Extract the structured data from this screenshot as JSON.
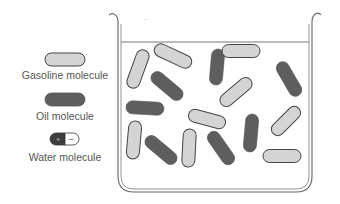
{
  "legend": [
    {
      "label": "Gasoline molecule",
      "type": "gasoline"
    },
    {
      "label": "Oil molecule",
      "type": "oil"
    },
    {
      "label": "Water molecule",
      "type": "water",
      "left_sign": "+",
      "right_sign": "−"
    }
  ],
  "colors": {
    "gasoline_fill": "#d4d4d4",
    "oil_fill": "#5e5e5e",
    "outline": "#444444",
    "beaker": "#666666",
    "text": "#555555"
  },
  "beaker": {
    "top_mark": "..."
  },
  "molecules": [
    {
      "type": "gasoline",
      "cx": 138,
      "cy": 69,
      "len": 40,
      "angle": -70
    },
    {
      "type": "gasoline",
      "cx": 173,
      "cy": 56,
      "len": 40,
      "angle": 25
    },
    {
      "type": "oil",
      "cx": 217,
      "cy": 67,
      "len": 36,
      "angle": -85
    },
    {
      "type": "gasoline",
      "cx": 241,
      "cy": 51,
      "len": 38,
      "angle": 0
    },
    {
      "type": "oil",
      "cx": 289,
      "cy": 79,
      "len": 38,
      "angle": 60
    },
    {
      "type": "oil",
      "cx": 167,
      "cy": 86,
      "len": 38,
      "angle": 40
    },
    {
      "type": "gasoline",
      "cx": 236,
      "cy": 92,
      "len": 38,
      "angle": -40
    },
    {
      "type": "oil",
      "cx": 145,
      "cy": 108,
      "len": 38,
      "angle": 3
    },
    {
      "type": "gasoline",
      "cx": 207,
      "cy": 119,
      "len": 38,
      "angle": 15
    },
    {
      "type": "gasoline",
      "cx": 286,
      "cy": 121,
      "len": 36,
      "angle": -45
    },
    {
      "type": "oil",
      "cx": 251,
      "cy": 133,
      "len": 38,
      "angle": -85
    },
    {
      "type": "gasoline",
      "cx": 134,
      "cy": 140,
      "len": 38,
      "angle": -85
    },
    {
      "type": "oil",
      "cx": 161,
      "cy": 150,
      "len": 38,
      "angle": 40
    },
    {
      "type": "gasoline",
      "cx": 189,
      "cy": 148,
      "len": 38,
      "angle": -87
    },
    {
      "type": "oil",
      "cx": 221,
      "cy": 148,
      "len": 38,
      "angle": 55
    },
    {
      "type": "gasoline",
      "cx": 282,
      "cy": 156,
      "len": 38,
      "angle": 0
    }
  ]
}
